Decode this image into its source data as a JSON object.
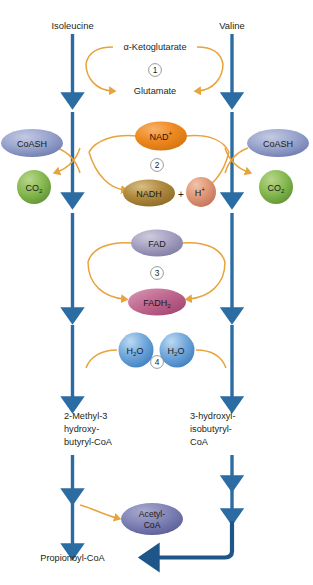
{
  "diagram": {
    "colors": {
      "arrow_blue": "#2b6ca3",
      "arrow_blue_dark": "#1f5689",
      "curve_orange": "#e8a33d",
      "coash_fill": "#8e9ac6",
      "co2_fill": "#7fb24a",
      "nad_fill": "#ef8a22",
      "nadh_fill": "#b08a3e",
      "hplus_fill": "#e09878",
      "fad_fill": "#9b96b8",
      "fadh2_fill": "#bf5f8e",
      "h2o_fill": "#5b9bd5",
      "acetylcoa_fill": "#7b7fb5",
      "text_dark": "#231f20",
      "ring_stroke": "#6d6e71",
      "background": "#ffffff"
    },
    "substrates": [
      {
        "id": "isoleucine",
        "label": "Isoleucine",
        "column": "left"
      },
      {
        "id": "valine",
        "label": "Valine",
        "column": "right"
      }
    ],
    "steps": [
      {
        "number": "1",
        "number_glyph": "①",
        "cofactor_in": "α-Ketoglutarate",
        "cofactor_out": "Glutamate",
        "shape": "text-only"
      },
      {
        "number": "2",
        "number_glyph": "②",
        "cofactor_in": "NAD+",
        "cofactor_out": "NADH",
        "cofactor_out_extra": "H+",
        "side_in": "CoASH",
        "side_out": "CO2",
        "shape": "ellipse"
      },
      {
        "number": "3",
        "number_glyph": "③",
        "cofactor_in": "FAD",
        "cofactor_out": "FADH2",
        "shape": "ellipse"
      },
      {
        "number": "4",
        "number_glyph": "④",
        "cofactor_in": "H2O",
        "shape": "circle"
      }
    ],
    "nodes": {
      "alpha_ketoglutarate": "α-Ketoglutarate",
      "glutamate": "Glutamate",
      "coash_left": "CoASH",
      "coash_right": "CoASH",
      "co2_left_main": "CO",
      "co2_left_sub": "2",
      "co2_right_main": "CO",
      "co2_right_sub": "2",
      "nad_main": "NAD",
      "nad_sup": "+",
      "nadh": "NADH",
      "plus": "+",
      "hplus_main": "H",
      "hplus_sup": "+",
      "fad": "FAD",
      "fadh2_main": "FADH",
      "fadh2_sub": "2",
      "h2o_left": {
        "h": "H",
        "sub": "2",
        "o": "O"
      },
      "h2o_right": {
        "h": "H",
        "sub": "2",
        "o": "O"
      },
      "acetyl_coa_line1": "Acetyl-",
      "acetyl_coa_line2": "CoA"
    },
    "intermediates": {
      "left": [
        "2-Methyl-3",
        "hydroxy-",
        "butyryl-CoA"
      ],
      "right": [
        "3-hydroxyl-",
        "isobutyryl-",
        "CoA"
      ]
    },
    "product": "Propionoyl-CoA",
    "step_numbers": [
      "1",
      "2",
      "3",
      "4"
    ]
  }
}
